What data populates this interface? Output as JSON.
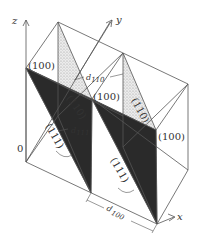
{
  "diagram": {
    "type": "crystal lattice planes in cubic cells",
    "axes": {
      "x": "x",
      "y": "y",
      "z": "z",
      "origin": "0"
    },
    "planes": {
      "p100_top_left": "(100)",
      "p100_mid": "(100)",
      "p100_right": "(100)",
      "p110_left": "(110)",
      "p110_right": "(110)",
      "p111_left": "(111)",
      "p111_right": "(111)"
    },
    "spacings": {
      "d110": "d",
      "d110_sub": "110",
      "d111": "d",
      "d111_sub": "111",
      "d100": "d",
      "d100_sub": "100"
    },
    "colors": {
      "line": "#555555",
      "plane_111": "#222222",
      "plane_110": "#d8d8d8"
    }
  }
}
